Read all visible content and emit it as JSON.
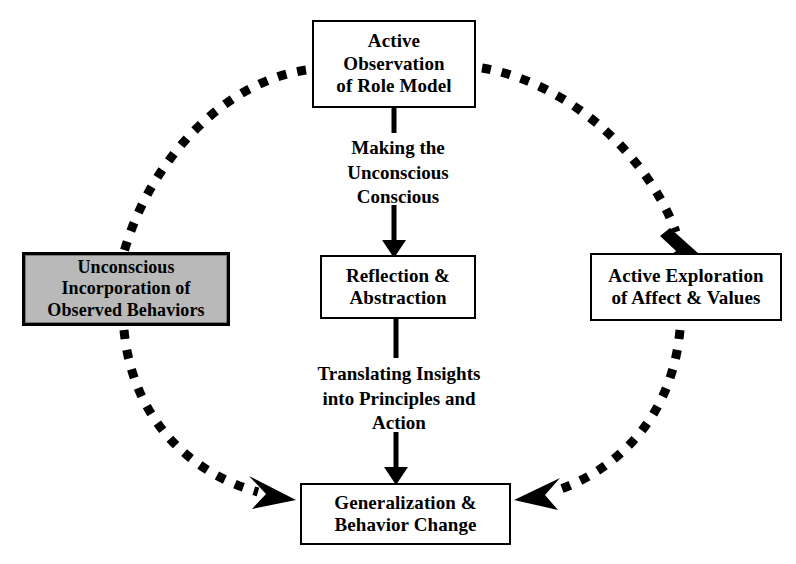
{
  "diagram": {
    "background_color": "#ffffff",
    "stroke_color": "#000000",
    "highlight_fill": "#b9b9b9"
  },
  "nodes": {
    "observation": {
      "label": "Active\nObservation\nof Role Model",
      "fill": "#ffffff"
    },
    "unconscious": {
      "label": "Unconscious\nIncorporation of\nObserved Behaviors",
      "fill": "#b9b9b9"
    },
    "reflection": {
      "label": "Reflection &\nAbstraction",
      "fill": "#ffffff"
    },
    "exploration": {
      "label": "Active Exploration\nof Affect & Values",
      "fill": "#ffffff"
    },
    "generalization": {
      "label": "Generalization &\nBehavior Change",
      "fill": "#ffffff"
    }
  },
  "edge_labels": {
    "making": "Making the\nUnconscious\nConscious",
    "translating": "Translating Insights\ninto Principles and\nAction"
  },
  "edges": [
    {
      "name": "observation-to-reflection",
      "style": "solid-arrow",
      "from": "observation",
      "to": "reflection",
      "label": "Making the Unconscious Conscious"
    },
    {
      "name": "reflection-to-generalization",
      "style": "solid-arrow",
      "from": "reflection",
      "to": "generalization",
      "label": "Translating Insights into Principles and Action"
    },
    {
      "name": "observation-to-unconscious",
      "style": "dotted-arc",
      "from": "observation",
      "to": "unconscious",
      "label": ""
    },
    {
      "name": "unconscious-to-generalization",
      "style": "dotted-arc-arrow",
      "from": "unconscious",
      "to": "generalization",
      "label": ""
    },
    {
      "name": "observation-to-exploration",
      "style": "dotted-arc-arrow",
      "from": "observation",
      "to": "exploration",
      "label": ""
    },
    {
      "name": "exploration-to-generalization",
      "style": "dotted-arc-arrow",
      "from": "exploration",
      "to": "generalization",
      "label": ""
    }
  ]
}
